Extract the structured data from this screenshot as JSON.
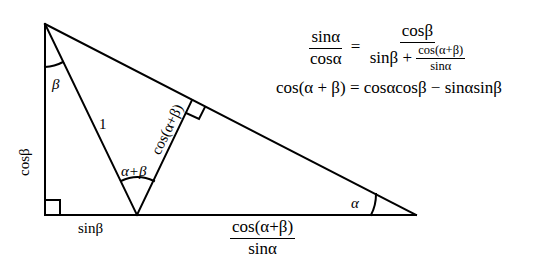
{
  "figure": {
    "type": "trigonometry-triangle-diagram",
    "line_color": "#000000",
    "background": "#ffffff",
    "vertices": {
      "top": [
        45,
        24
      ],
      "bottom_left": [
        45,
        215
      ],
      "inner": [
        137,
        215
      ],
      "right": [
        416,
        215
      ],
      "perp_foot": [
        192,
        100
      ]
    }
  },
  "labels": {
    "beta": "β",
    "one": "1",
    "alpha_plus_beta": "α+β",
    "cos_alpha_plus_beta": "cos(α+β)",
    "cos_beta": "cosβ",
    "sin_beta": "sinβ",
    "alpha": "α",
    "bottom_frac_num": "cos(α+β)",
    "bottom_frac_den": "sinα"
  },
  "equations": {
    "eq1": {
      "lhs_num": "sinα",
      "lhs_den": "cosα",
      "equals": "=",
      "rhs_num": "cosβ",
      "rhs_den_prefix": "sinβ +",
      "rhs_den_frac_num": "cos(α+β)",
      "rhs_den_frac_den": "sinα"
    },
    "eq2": "cos(α + β) = cosαcosβ − sinαsinβ"
  }
}
